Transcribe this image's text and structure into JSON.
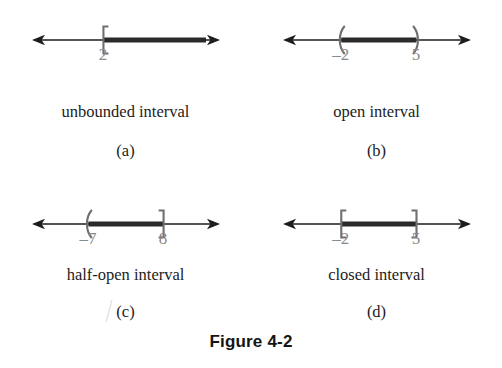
{
  "figure": {
    "caption": "Figure 4-2",
    "line_color": "#1d1d1d",
    "segment_color": "#2a2a2a",
    "bracket_color": "#6f6f6f",
    "tick_label_color": "#8a8a8a",
    "background": "#ffffff"
  },
  "panels": [
    {
      "letter": "(a)",
      "caption": "unbounded interval",
      "interval_type": "unbounded",
      "left_endpoint": {
        "label": "2",
        "mark": "left-square-bracket",
        "included": true,
        "x_pct": 38
      },
      "right_endpoint": {
        "label": "",
        "mark": "arrow",
        "included": false,
        "x_pct": 100
      },
      "segment": {
        "from_pct": 38,
        "to_pct": 100
      },
      "arrows": {
        "left": true,
        "right": true
      }
    },
    {
      "letter": "(b)",
      "caption": "open interval",
      "interval_type": "open",
      "left_endpoint": {
        "label": "–2",
        "mark": "left-parenthesis",
        "included": false,
        "x_pct": 31
      },
      "right_endpoint": {
        "label": "5",
        "mark": "right-parenthesis",
        "included": false,
        "x_pct": 71
      },
      "segment": {
        "from_pct": 31,
        "to_pct": 71
      },
      "arrows": {
        "left": true,
        "right": true
      }
    },
    {
      "letter": "(c)",
      "caption": "half-open interval",
      "interval_type": "half-open",
      "left_endpoint": {
        "label": "–7",
        "mark": "left-parenthesis",
        "included": false,
        "x_pct": 30
      },
      "right_endpoint": {
        "label": "8",
        "mark": "right-square-bracket",
        "included": true,
        "x_pct": 70
      },
      "segment": {
        "from_pct": 30,
        "to_pct": 70
      },
      "arrows": {
        "left": true,
        "right": true
      }
    },
    {
      "letter": "(d)",
      "caption": "closed interval",
      "interval_type": "closed",
      "left_endpoint": {
        "label": "–2",
        "mark": "left-square-bracket",
        "included": true,
        "x_pct": 31
      },
      "right_endpoint": {
        "label": "5",
        "mark": "right-square-bracket",
        "included": true,
        "x_pct": 71
      },
      "segment": {
        "from_pct": 31,
        "to_pct": 71
      },
      "arrows": {
        "left": true,
        "right": true
      }
    }
  ]
}
